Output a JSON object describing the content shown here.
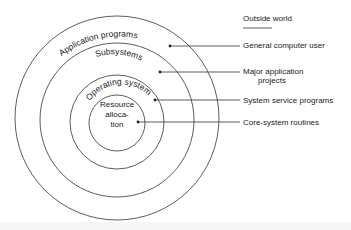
{
  "diagram": {
    "header": "Outside world",
    "rings": [
      {
        "label": "Application programs",
        "role": "General computer user"
      },
      {
        "label": "Subsystems",
        "role": "Major application projects",
        "role_lines": [
          "Major application",
          "projects"
        ]
      },
      {
        "label": "Operating system",
        "role": "System service programs"
      },
      {
        "label": "Resource allocation",
        "label_lines": [
          "Resource",
          "alloca-",
          "tion"
        ],
        "role": "Core-system routines"
      }
    ],
    "colors": {
      "stroke": "#333333",
      "text": "#222222",
      "background": "#ffffff"
    }
  }
}
